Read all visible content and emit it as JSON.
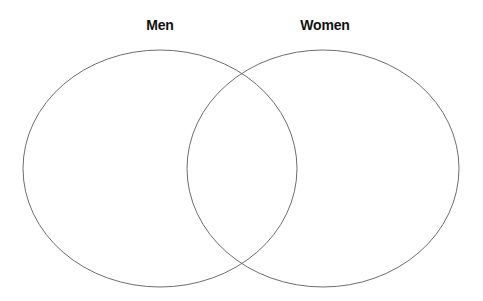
{
  "diagram": {
    "type": "venn",
    "sets": [
      {
        "label": "Men",
        "cx": 160,
        "cy": 168.5,
        "rx": 137,
        "ry": 118.5
      },
      {
        "label": "Women",
        "cx": 323,
        "cy": 168.5,
        "rx": 136,
        "ry": 118.5
      }
    ],
    "stroke_color": "#6e6e6e",
    "background": "#ffffff"
  }
}
